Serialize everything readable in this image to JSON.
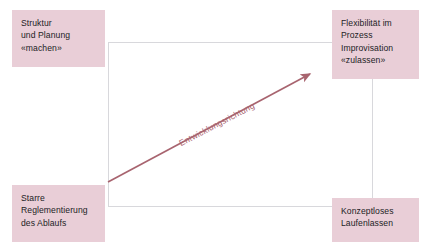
{
  "diagram": {
    "colors": {
      "box_fill": "#e9ced7",
      "box_text": "#221d1f",
      "frame_line": "#d8d8dc",
      "arrow": "#a8646f",
      "background": "#ffffff"
    },
    "quadrants": [
      {
        "position": "top-left",
        "name": "struktur-und-planung",
        "text": "Struktur\nund Planung\n«machen»"
      },
      {
        "position": "top-right",
        "name": "flexibilitaet-im-prozess",
        "text": "Flexibilität im\nProzess\nImprovisation\n«zulassen»"
      },
      {
        "position": "bottom-left",
        "name": "starre-reglementierung",
        "text": "Starre\nReglementierung\ndes Ablaufs"
      },
      {
        "position": "bottom-right",
        "name": "konzeptloses-laufenlassen",
        "text": "Konzeptloses\nLaufenlassen"
      }
    ],
    "arrow": {
      "label": "Entwicklungsrichtung",
      "direction": "bottom-left-to-top-right",
      "start": {
        "x": 108,
        "y": 182
      },
      "end": {
        "x": 313,
        "y": 72
      }
    }
  }
}
